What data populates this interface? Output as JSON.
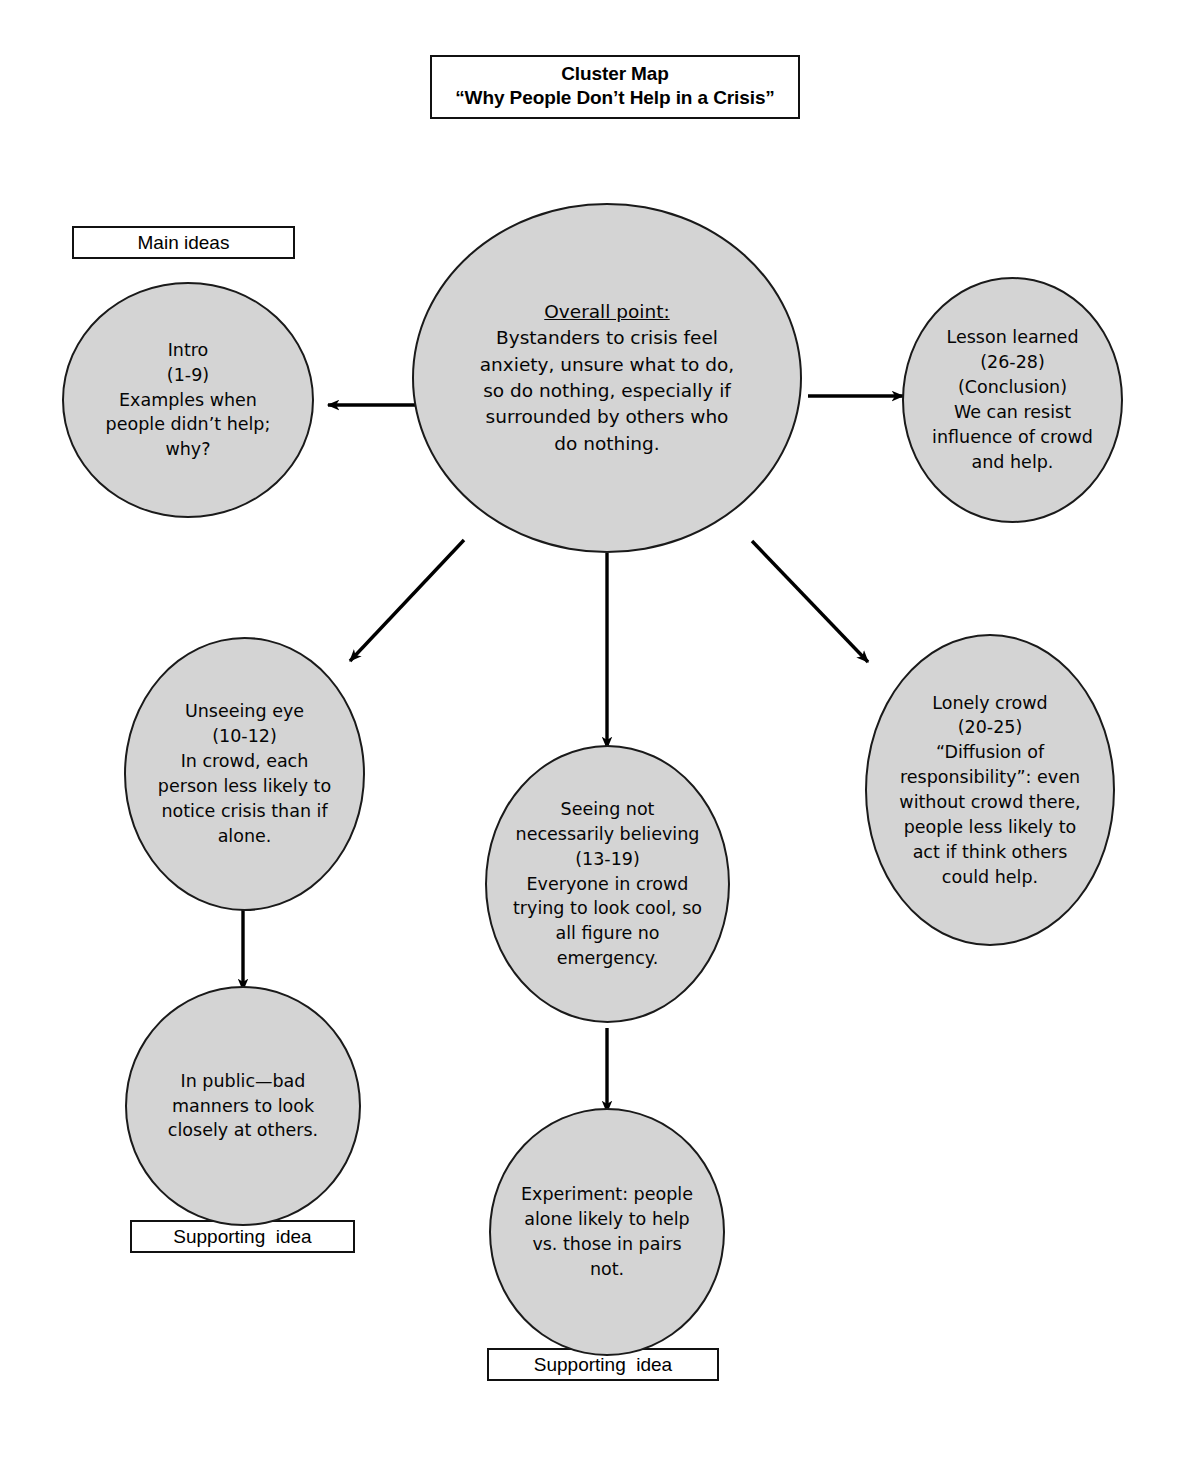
{
  "title": {
    "line1": "Cluster Map",
    "line2": "“Why People Don’t Help in a Crisis”"
  },
  "legend": {
    "main_ideas": "Main ideas",
    "supporting_idea_left": "Supporting  idea",
    "supporting_idea_bottom": "Supporting  idea"
  },
  "nodes": {
    "central": {
      "heading": "Overall point:",
      "body": "Bystanders to crisis feel\nanxiety, unsure what to do,\nso do nothing, especially if\nsurrounded by others who\ndo nothing."
    },
    "intro": {
      "text": "Intro\n(1-9)\nExamples when\npeople didn’t help;\nwhy?"
    },
    "lesson_learned": {
      "text": "Lesson learned\n(26-28)\n(Conclusion)\nWe can resist\ninfluence of crowd\nand help."
    },
    "unseeing_eye": {
      "text": "Unseeing eye\n(10-12)\nIn crowd, each\nperson less likely to\nnotice crisis than if\nalone."
    },
    "seeing_not_believing": {
      "text": "Seeing not\nnecessarily believing\n(13-19)\nEveryone in crowd\ntrying to look cool, so\nall figure no\nemergency."
    },
    "lonely_crowd": {
      "text": "Lonely crowd\n(20-25)\n“Diffusion of\nresponsibility”: even\nwithout crowd there,\npeople less likely to\nact if think others\ncould help."
    },
    "in_public": {
      "text": "In public—bad\nmanners to look\nclosely at others."
    },
    "experiment": {
      "text": "Experiment: people\nalone likely to help\nvs. those in pairs\nnot."
    }
  },
  "colors": {
    "node_fill": "#d4d4d4",
    "node_stroke": "#1a1a1a",
    "arrow": "#000000",
    "box_stroke": "#111111",
    "page_background": "#ffffff"
  },
  "connections": [
    {
      "from": "central",
      "to": "intro",
      "direction": "left"
    },
    {
      "from": "central",
      "to": "lesson_learned",
      "direction": "right"
    },
    {
      "from": "central",
      "to": "unseeing_eye",
      "direction": "down-left"
    },
    {
      "from": "central",
      "to": "seeing_not_believing",
      "direction": "down"
    },
    {
      "from": "central",
      "to": "lonely_crowd",
      "direction": "down-right"
    },
    {
      "from": "unseeing_eye",
      "to": "in_public",
      "direction": "down"
    },
    {
      "from": "seeing_not_believing",
      "to": "experiment",
      "direction": "down"
    }
  ]
}
